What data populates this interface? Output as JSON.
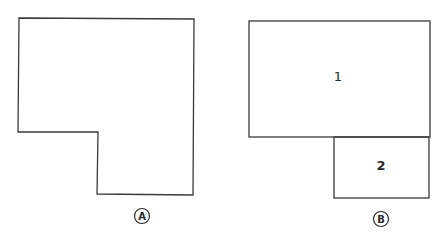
{
  "figures": [
    {
      "id": "A",
      "caption": "A",
      "description": "L-shaped outline (single region)",
      "regions": []
    },
    {
      "id": "B",
      "caption": "B",
      "description": "Same L-shape divided into two rectangles",
      "regions": [
        {
          "label": "1"
        },
        {
          "label": "2"
        }
      ]
    }
  ],
  "colors": {
    "stroke": "#3a3a3a",
    "background": "#ffffff"
  }
}
